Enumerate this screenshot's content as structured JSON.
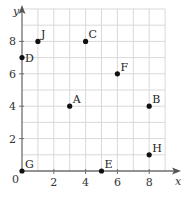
{
  "chart_data": {
    "type": "scatter",
    "title": "",
    "xlabel": "x",
    "ylabel": "y",
    "xlim": [
      0,
      9
    ],
    "ylim": [
      0,
      10
    ],
    "grid": true,
    "x_ticks": [
      0,
      2,
      4,
      6,
      8
    ],
    "y_ticks": [
      2,
      4,
      6,
      8
    ],
    "origin_label": "0",
    "points": [
      {
        "label": "A",
        "x": 3,
        "y": 4
      },
      {
        "label": "B",
        "x": 8,
        "y": 4
      },
      {
        "label": "C",
        "x": 4,
        "y": 8
      },
      {
        "label": "D",
        "x": 0,
        "y": 7
      },
      {
        "label": "E",
        "x": 5,
        "y": 0
      },
      {
        "label": "F",
        "x": 6,
        "y": 6
      },
      {
        "label": "G",
        "x": 0,
        "y": 0
      },
      {
        "label": "H",
        "x": 8,
        "y": 1
      },
      {
        "label": "J",
        "x": 1,
        "y": 8
      }
    ]
  }
}
